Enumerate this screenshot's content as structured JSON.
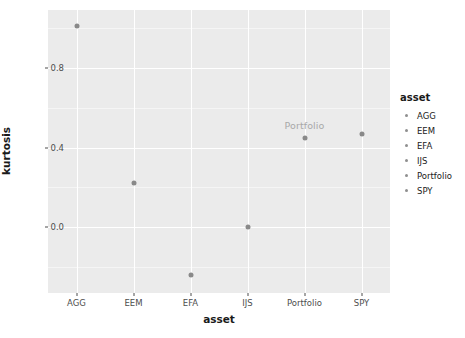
{
  "chart_data": {
    "type": "scatter",
    "title": "",
    "xlabel": "asset",
    "ylabel": "kurtosis",
    "categories": [
      "AGG",
      "EEM",
      "EFA",
      "IJS",
      "Portfolio",
      "SPY"
    ],
    "values": [
      1.01,
      0.22,
      -0.24,
      0.0,
      0.45,
      0.47
    ],
    "points": [
      {
        "x": "AGG",
        "y": 1.01,
        "label": ""
      },
      {
        "x": "EEM",
        "y": 0.22,
        "label": ""
      },
      {
        "x": "EFA",
        "y": -0.24,
        "label": ""
      },
      {
        "x": "IJS",
        "y": 0.0,
        "label": ""
      },
      {
        "x": "Portfolio",
        "y": 0.45,
        "label": "Portfolio"
      },
      {
        "x": "SPY",
        "y": 0.47,
        "label": ""
      }
    ],
    "ytick_labels": [
      "0.8",
      "0.4",
      "0.0"
    ],
    "ytick_values": [
      0.8,
      0.4,
      0.0
    ],
    "yminor_values": [
      1.0,
      0.6,
      0.2,
      -0.2
    ],
    "ylim": [
      -0.33,
      1.09
    ],
    "grid": true,
    "legend_position": "right",
    "colors": {
      "panel_background": "#ebebeb",
      "grid_major": "#ffffff",
      "grid_minor": "#f5f5f5",
      "point": "#898989",
      "point_label": "#a8a8a8",
      "axis_text": "#4d4d4d",
      "axis_title": "#1a1a1a"
    }
  },
  "legend": {
    "title": "asset",
    "items": [
      {
        "label": "AGG"
      },
      {
        "label": "EEM"
      },
      {
        "label": "EFA"
      },
      {
        "label": "IJS"
      },
      {
        "label": "Portfolio"
      },
      {
        "label": "SPY"
      }
    ]
  },
  "axes": {
    "x_title": "asset",
    "y_title": "kurtosis"
  }
}
